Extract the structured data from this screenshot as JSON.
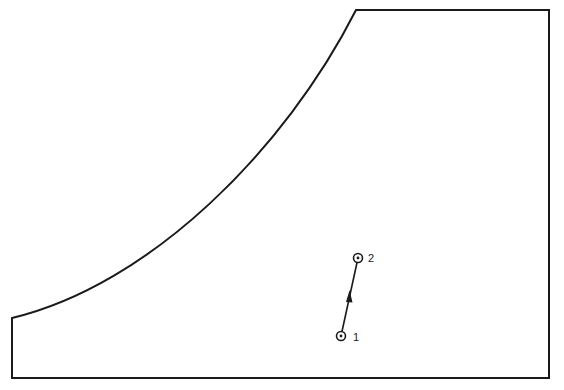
{
  "diagram": {
    "stroke_color": "#1a1a1a",
    "background": "#ffffff",
    "region": {
      "description": "Closed region bounded by vertical left edge, concave curved boundary, flat top, vertical right edge and flat bottom",
      "corners": {
        "bottom_left": [
          12,
          378
        ],
        "curve_start": [
          12,
          318
        ],
        "curve_end": [
          356,
          10
        ],
        "top_right": [
          549,
          10
        ],
        "bottom_right": [
          549,
          378
        ]
      }
    },
    "points": [
      {
        "id": "1",
        "label": "1",
        "x": 341,
        "y": 336
      },
      {
        "id": "2",
        "label": "2",
        "x": 358,
        "y": 258
      }
    ],
    "vector": {
      "from": "1",
      "to": "2",
      "arrow_mid": true
    }
  }
}
